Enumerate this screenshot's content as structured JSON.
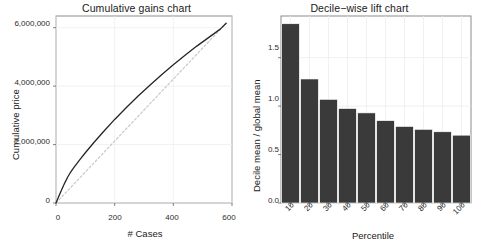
{
  "chart_data": [
    {
      "type": "line",
      "title": "Cumulative gains chart",
      "xlabel": "# Cases",
      "ylabel": "Cumulative price",
      "xlim": [
        0,
        600
      ],
      "ylim": [
        0,
        6400000
      ],
      "xticks": [
        0,
        200,
        400,
        600
      ],
      "xticklabels": [
        "0",
        "200",
        "400",
        "600"
      ],
      "yticks": [
        0,
        2000000,
        4000000,
        6000000
      ],
      "yticklabels": [
        "0",
        "2,000,000",
        "4,000,000",
        "6,000,000"
      ],
      "grid": true,
      "legend": "none",
      "series": [
        {
          "name": "cumulative gains",
          "style": "solid",
          "color": "#252525",
          "x": [
            0,
            10,
            20,
            30,
            40,
            50,
            60,
            80,
            100,
            130,
            160,
            200,
            240,
            280,
            320,
            360,
            400,
            440,
            480,
            520,
            560,
            580
          ],
          "y": [
            0,
            240000,
            470000,
            690000,
            890000,
            1060000,
            1200000,
            1470000,
            1720000,
            2080000,
            2420000,
            2860000,
            3270000,
            3660000,
            4030000,
            4390000,
            4730000,
            5060000,
            5370000,
            5660000,
            5950000,
            6150000
          ]
        },
        {
          "name": "baseline",
          "style": "dashed",
          "color": "#c8c8c8",
          "x": [
            0,
            580
          ],
          "y": [
            0,
            6150000
          ]
        }
      ]
    },
    {
      "type": "bar",
      "title": "Decile−wise lift chart",
      "xlabel": "Percentile",
      "ylabel": "Decile mean / global mean",
      "categories": [
        "10",
        "20",
        "30",
        "40",
        "50",
        "60",
        "70",
        "80",
        "90",
        "100"
      ],
      "values": [
        1.85,
        1.28,
        1.07,
        0.975,
        0.93,
        0.85,
        0.79,
        0.76,
        0.735,
        0.7
      ],
      "ylim": [
        0,
        1.93
      ],
      "yticks": [
        0.0,
        0.5,
        1.0,
        1.5
      ],
      "yticklabels": [
        "0.0",
        "0.5",
        "1.0",
        "1.5"
      ],
      "bar_color": "#3a3a3a",
      "grid": true,
      "legend": "none"
    }
  ]
}
